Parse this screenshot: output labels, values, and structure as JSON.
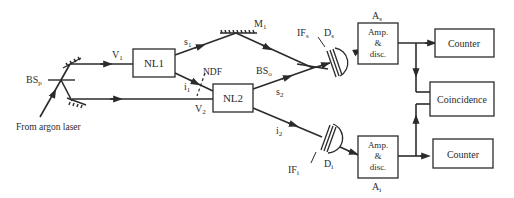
{
  "diagram": {
    "source_label": "From argon laser",
    "labels": {
      "bs_p": "BS",
      "bs_p_sub": "p",
      "v1": "V",
      "v1_sub": "1",
      "v2": "V",
      "v2_sub": "2",
      "s1": "s",
      "s1_sub": "1",
      "s2": "s",
      "s2_sub": "2",
      "i1": "i",
      "i1_sub": "1",
      "i2": "i",
      "i2_sub": "2",
      "m1": "M",
      "m1_sub": "1",
      "ndf": "NDF",
      "bs_o": "BS",
      "bs_o_sub": "o",
      "if_s": "IF",
      "if_s_sub": "s",
      "d_s": "D",
      "d_s_sub": "s",
      "if_i": "IF",
      "if_i_sub": "i",
      "d_i": "D",
      "d_i_sub": "i",
      "a_s": "A",
      "a_s_sub": "s",
      "a_i": "A",
      "a_i_sub": "i"
    },
    "boxes": {
      "nl1": "NL1",
      "nl2": "NL2",
      "amp_s": [
        "Amp.",
        "&",
        "disc."
      ],
      "amp_i": [
        "Amp.",
        "&",
        "disc."
      ],
      "counter_s": "Counter",
      "counter_i": "Counter",
      "coincidence": "Coincidence"
    },
    "line_color": "#2b2b2b"
  }
}
